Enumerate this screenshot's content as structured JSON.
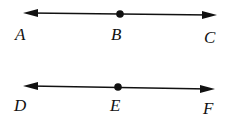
{
  "diagram": {
    "lines": [
      {
        "name": "line-ac",
        "points": [
          {
            "label": "A",
            "x": 22,
            "y": 40
          },
          {
            "label": "B",
            "x": 118,
            "y": 40
          },
          {
            "label": "C",
            "x": 212,
            "y": 43
          }
        ],
        "line": {
          "x1": 24,
          "y1": 13,
          "x2": 217,
          "y2": 15
        },
        "dot": {
          "x": 120,
          "y": 14
        }
      },
      {
        "name": "line-df",
        "points": [
          {
            "label": "D",
            "x": 22,
            "y": 111
          },
          {
            "label": "E",
            "x": 116,
            "y": 111
          },
          {
            "label": "F",
            "x": 208,
            "y": 114
          }
        ],
        "line": {
          "x1": 23,
          "y1": 86,
          "x2": 215,
          "y2": 89
        },
        "dot": {
          "x": 118,
          "y": 87
        }
      }
    ],
    "stroke_color": "#111111"
  }
}
